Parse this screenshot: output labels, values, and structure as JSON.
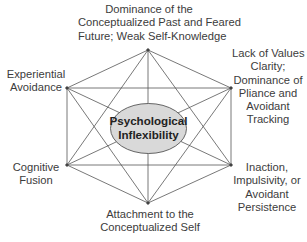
{
  "diagram": {
    "center": {
      "line1": "Psychological",
      "line2": "Inflexibility",
      "fill": "#d9d9d9",
      "stroke": "#555555"
    },
    "line_color": "#555555",
    "nodes": [
      {
        "id": "top",
        "x": 148,
        "y": 50,
        "lines": [
          "Dominance of the",
          "Conceptualized Past and Feared",
          "Future; Weak Self-Knowledge"
        ]
      },
      {
        "id": "top-right",
        "x": 231,
        "y": 88,
        "lines": [
          "Lack of Values",
          "Clarity;",
          "Dominance of",
          "Pliance and",
          "Avoidant",
          "Tracking"
        ]
      },
      {
        "id": "bottom-right",
        "x": 231,
        "y": 165,
        "lines": [
          "Inaction,",
          "Impulsivity, or",
          "Avoidant",
          "Persistence"
        ]
      },
      {
        "id": "bottom",
        "x": 148,
        "y": 203,
        "lines": [
          "Attachment to the",
          "Conceptualized Self"
        ]
      },
      {
        "id": "bottom-left",
        "x": 67,
        "y": 165,
        "lines": [
          "Cognitive",
          "Fusion"
        ]
      },
      {
        "id": "top-left",
        "x": 67,
        "y": 88,
        "lines": [
          "Experiential",
          "Avoidance"
        ]
      }
    ]
  }
}
